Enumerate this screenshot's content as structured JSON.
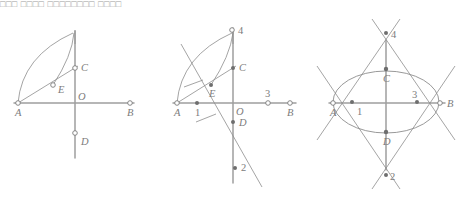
{
  "caption": {
    "text": "□□□ □□□□ □□□□□□□□ □□□□"
  },
  "figure": {
    "title": "Three-step geometric construction of an ellipse from axes",
    "panels": [
      {
        "id": "panel-1",
        "name": "step-1-arcs-from-A",
        "points": [
          {
            "key": "A",
            "label": "A",
            "x": 18,
            "y": 103,
            "style": "ring",
            "label_dx": -3,
            "label_dy": 13
          },
          {
            "key": "B",
            "label": "B",
            "x": 130,
            "y": 103,
            "style": "ring",
            "label_dx": -3,
            "label_dy": 13
          },
          {
            "key": "C",
            "label": "C",
            "x": 75,
            "y": 68,
            "style": "ring",
            "label_dx": 6,
            "label_dy": 3
          },
          {
            "key": "D",
            "label": "D",
            "x": 75,
            "y": 133,
            "style": "ring",
            "label_dx": 6,
            "label_dy": 12
          },
          {
            "key": "E",
            "label": "E",
            "x": 53,
            "y": 85,
            "style": "ring",
            "label_dx": 5,
            "label_dy": 8
          },
          {
            "key": "O",
            "label": "O",
            "x": 75,
            "y": 103,
            "style": "none",
            "label_dx": 3,
            "label_dy": -3
          }
        ]
      },
      {
        "id": "panel-2",
        "name": "step-2-locate-foci-and-points-1-2-3-4",
        "points": [
          {
            "key": "A",
            "label": "A",
            "x": 177,
            "y": 103,
            "style": "ring",
            "label_dx": -3,
            "label_dy": 13
          },
          {
            "key": "B",
            "label": "B",
            "x": 290,
            "y": 103,
            "style": "ring",
            "label_dx": -3,
            "label_dy": 13
          },
          {
            "key": "C",
            "label": "C",
            "x": 233,
            "y": 68,
            "style": "dot",
            "label_dx": 6,
            "label_dy": 3
          },
          {
            "key": "D",
            "label": "D",
            "x": 233,
            "y": 122,
            "style": "dot",
            "label_dx": 6,
            "label_dy": 4
          },
          {
            "key": "E",
            "label": "E",
            "x": 211,
            "y": 85,
            "style": "dot",
            "label_dx": 0,
            "label_dy": 12
          },
          {
            "key": "O",
            "label": "O",
            "x": 233,
            "y": 103,
            "style": "none",
            "label_dx": 3,
            "label_dy": 12
          },
          {
            "key": "1",
            "label": "1",
            "x": 197,
            "y": 103,
            "style": "dot",
            "label_dx": -2,
            "label_dy": 13
          },
          {
            "key": "2",
            "label": "2",
            "x": 235,
            "y": 168,
            "style": "dot",
            "label_dx": 6,
            "label_dy": 3
          },
          {
            "key": "3",
            "label": "3",
            "x": 268,
            "y": 103,
            "style": "ring",
            "label_dx": -3,
            "label_dy": -6
          },
          {
            "key": "4",
            "label": "4",
            "x": 232,
            "y": 30,
            "style": "ring",
            "label_dx": 6,
            "label_dy": 4
          }
        ]
      },
      {
        "id": "panel-3",
        "name": "step-3-completed-ellipse",
        "points": [
          {
            "key": "A",
            "label": "A",
            "x": 333,
            "y": 103,
            "style": "ring",
            "label_dx": -3,
            "label_dy": 13
          },
          {
            "key": "B",
            "label": "B",
            "x": 440,
            "y": 103,
            "style": "ring",
            "label_dx": 6,
            "label_dy": 4
          },
          {
            "key": "C",
            "label": "C",
            "x": 386,
            "y": 69,
            "style": "dot",
            "label_dx": 0,
            "label_dy": 12
          },
          {
            "key": "D",
            "label": "D",
            "x": 386,
            "y": 132,
            "style": "dot",
            "label_dx": 0,
            "label_dy": 12
          },
          {
            "key": "1",
            "label": "1",
            "x": 352,
            "y": 102,
            "style": "dot",
            "label_dx": 5,
            "label_dy": 12
          },
          {
            "key": "2",
            "label": "2",
            "x": 386,
            "y": 175,
            "style": "dot",
            "label_dx": 4,
            "label_dy": 4
          },
          {
            "key": "3",
            "label": "3",
            "x": 417,
            "y": 102,
            "style": "dot",
            "label_dx": -4,
            "label_dy": -5
          },
          {
            "key": "4",
            "label": "4",
            "x": 386,
            "y": 33,
            "style": "dot",
            "label_dx": 5,
            "label_dy": 4
          }
        ]
      }
    ]
  }
}
